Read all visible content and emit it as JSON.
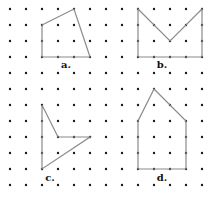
{
  "grid": {
    "origin_x": 10,
    "origin_y": 9,
    "spacing": 16,
    "cols": 13,
    "rows": 12,
    "dot_color": "#1a1a1a",
    "dot_radius": 1.2
  },
  "line_color": "#8a8a8a",
  "shapes": [
    {
      "label": "a.",
      "label_pos": [
        66,
        68
      ],
      "vertices": [
        [
          2,
          1
        ],
        [
          4,
          0
        ],
        [
          5,
          3
        ],
        [
          2,
          3
        ]
      ]
    },
    {
      "label": "b.",
      "label_pos": [
        162,
        68
      ],
      "vertices": [
        [
          8,
          0
        ],
        [
          10,
          2
        ],
        [
          12,
          0
        ],
        [
          12,
          3
        ],
        [
          8,
          3
        ]
      ]
    },
    {
      "label": "c.",
      "label_pos": [
        50,
        181
      ],
      "vertices": [
        [
          2,
          6
        ],
        [
          3,
          8
        ],
        [
          5,
          8
        ],
        [
          2,
          10
        ]
      ]
    },
    {
      "label": "d.",
      "label_pos": [
        162,
        181
      ],
      "vertices": [
        [
          9,
          5
        ],
        [
          11,
          7
        ],
        [
          11,
          10
        ],
        [
          8,
          10
        ],
        [
          8,
          7
        ]
      ]
    }
  ]
}
